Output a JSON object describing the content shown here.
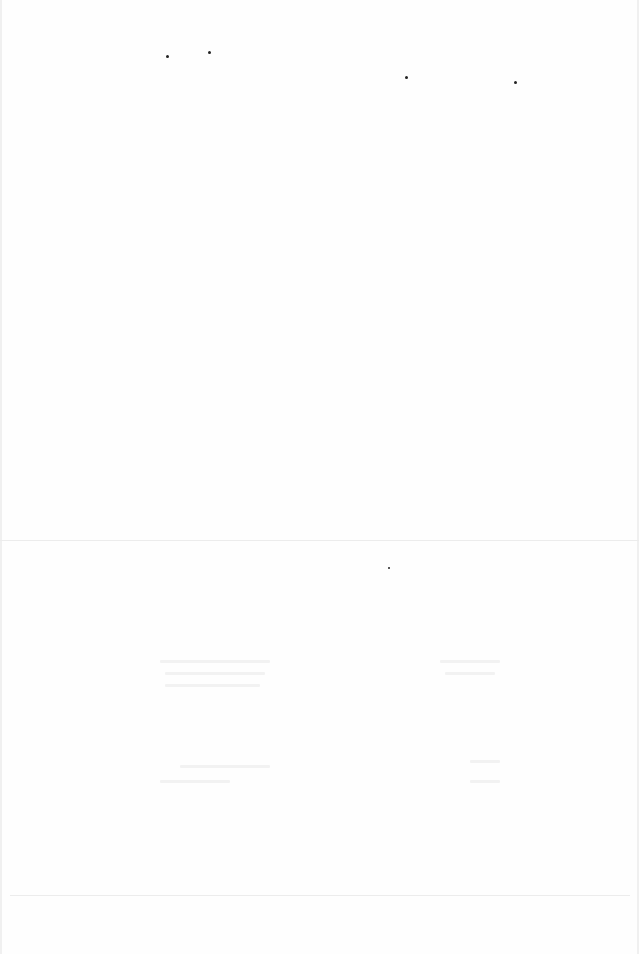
{
  "document": {
    "type": "scanned-page",
    "legible_text": [],
    "colors": {
      "background": "#fefefe",
      "marks": "#222222",
      "faint": "#ececec"
    }
  }
}
